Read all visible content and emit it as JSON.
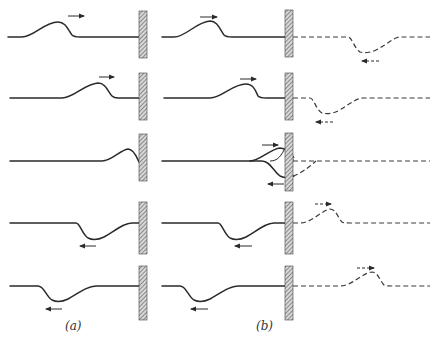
{
  "figure": {
    "panels": [
      {
        "id": "a",
        "label": "(a)"
      },
      {
        "id": "b",
        "label": "(b)"
      }
    ],
    "rows": 5,
    "colors": {
      "line": "#2a2a2a",
      "wall_hatch": "#555555",
      "background": "#ffffff"
    },
    "legend": {
      "solid_line": "actual string displacement",
      "dashed_line": "virtual (image) pulse beyond wall",
      "arrow": "direction of pulse travel"
    }
  }
}
